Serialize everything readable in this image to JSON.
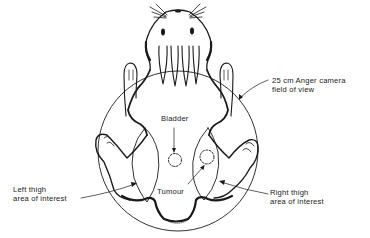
{
  "figure": {
    "colors": {
      "ink": "#1a1a1a",
      "background": "#ffffff"
    }
  },
  "labels": {
    "camera_line1": "25 cm Anger camera",
    "camera_line2": "field of view",
    "bladder": "Bladder",
    "tumour": "Tumour",
    "left_line1": "Left thigh",
    "left_line2": "area of interest",
    "right_line1": "Right thigh",
    "right_line2": "area of interest"
  }
}
